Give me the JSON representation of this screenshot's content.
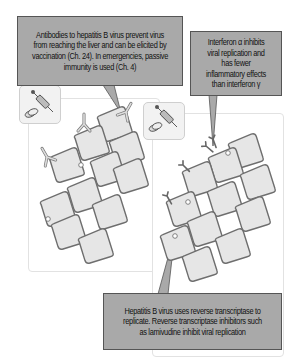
{
  "callouts": {
    "antibodies": "Antibodies to hepatitis B virus prevent virus from reaching the liver and can be elicited by vaccination (Ch. 24). In emergencies, passive immunity is used (Ch. 4)",
    "interferon": "Interferon α inhibits viral replication and has fewer inflammatory effects than interferon γ",
    "reverse_transcriptase": "Hepatitis B virus uses reverse transcriptase to replicate. Reverse transcriptase inhibitors such as lamivudine inhibit viral replication"
  },
  "panels": [
    {
      "name": "antibody-panel",
      "icon": "vaccine-syringe-and-pills-icon",
      "cells": 12,
      "agents": "antibody"
    },
    {
      "name": "antiviral-panel",
      "icon": "vaccine-syringe-and-pills-icon",
      "cells": 12,
      "agents": "interferon"
    }
  ],
  "colors": {
    "callout_fill": "#a9a9a9",
    "cell_fill": "#e6e6e6",
    "cell_border": "#6e6e6e",
    "panel_border": "#e2e2e2"
  }
}
